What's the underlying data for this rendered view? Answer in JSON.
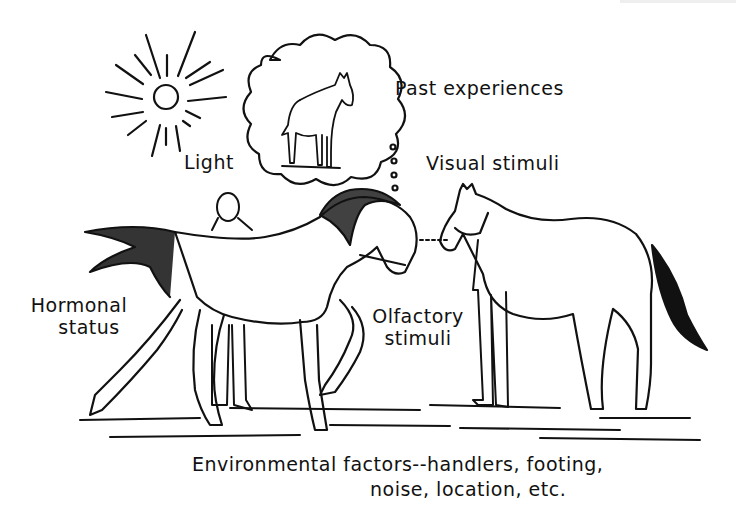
{
  "labels": {
    "light": "Light",
    "past_experiences": "Past experiences",
    "visual_stimuli": "Visual stimuli",
    "hormonal_status_line1": "Hormonal",
    "hormonal_status_line2": "status",
    "olfactory_stimuli_line1": "Olfactory",
    "olfactory_stimuli_line2": "stimuli",
    "environmental_line1": "Environmental factors--handlers, footing,",
    "environmental_line2": "noise, location, etc."
  },
  "colors": {
    "ink": "#111111",
    "background": "#ffffff"
  },
  "icons": {
    "sun": "sun-icon",
    "thought_bubble": "thought-bubble-icon",
    "horse_left": "horse-prancing-illustration",
    "horse_right": "horse-standing-illustration",
    "handler_left": "person-illustration",
    "handler_right": "person-illustration"
  }
}
